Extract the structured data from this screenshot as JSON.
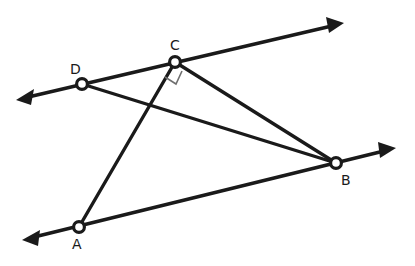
{
  "figure": {
    "kind": "geometry-diagram",
    "width": 415,
    "height": 266,
    "background_color": "#ffffff",
    "stroke_color": "#1a1a1a",
    "right_angle_color": "#6f6f6f"
  },
  "points": [
    {
      "id": "C",
      "label": "C",
      "x": 175,
      "y": 62,
      "label_x": 170,
      "label_y": 38
    },
    {
      "id": "D",
      "label": "D",
      "x": 82,
      "y": 84,
      "label_x": 70,
      "label_y": 62
    },
    {
      "id": "B",
      "label": "B",
      "x": 336,
      "y": 163,
      "label_x": 341,
      "label_y": 173
    },
    {
      "id": "A",
      "label": "A",
      "x": 79,
      "y": 227,
      "label_x": 72,
      "label_y": 237
    }
  ],
  "rays": [
    {
      "id": "ray-upper",
      "name": "upper-ray-through-D-and-C",
      "x1": 24,
      "y1": 98,
      "x2": 336,
      "y2": 25,
      "tip1_x": 16,
      "tip1_y": 100,
      "tip2_x": 344,
      "tip2_y": 23,
      "double_headed": true,
      "passes_through": [
        "D",
        "C"
      ]
    },
    {
      "id": "ray-lower",
      "name": "lower-ray-through-A-and-B",
      "x1": 30,
      "y1": 238,
      "x2": 388,
      "y2": 150,
      "tip1_x": 22,
      "tip1_y": 240,
      "tip2_x": 396,
      "tip2_y": 148,
      "double_headed": true,
      "passes_through": [
        "A",
        "B"
      ]
    }
  ],
  "segments": [
    {
      "id": "seg-CA",
      "name": "segment-C-to-A",
      "from": "C",
      "to": "A",
      "x1": 175,
      "y1": 62,
      "x2": 79,
      "y2": 227
    },
    {
      "id": "seg-CB",
      "name": "segment-C-to-B",
      "from": "C",
      "to": "B",
      "x1": 175,
      "y1": 62,
      "x2": 336,
      "y2": 163
    },
    {
      "id": "seg-DB",
      "name": "segment-D-to-B",
      "from": "D",
      "to": "B",
      "x1": 82,
      "y1": 84,
      "x2": 336,
      "y2": 163
    }
  ],
  "angle_markers": [
    {
      "id": "right-angle-C",
      "name": "right-angle-marker-at-C",
      "at_point": "C",
      "measure_degrees": 90,
      "style": "square",
      "points": "182,71 176,84 165,77"
    }
  ],
  "labels": {
    "A": "A",
    "B": "B",
    "C": "C",
    "D": "D"
  }
}
